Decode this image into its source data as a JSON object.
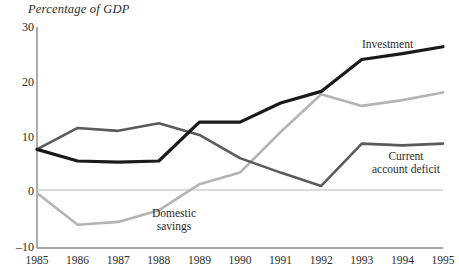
{
  "chart_data": {
    "type": "line",
    "title": "Percentage of GDP",
    "xlabel": "",
    "ylabel": "Percentage of GDP",
    "ylim": [
      -10,
      30
    ],
    "xlim": [
      1985,
      1995
    ],
    "yticks": [
      "30",
      "20",
      "10",
      "0",
      "–10"
    ],
    "ytick_values": [
      30,
      20,
      10,
      0,
      -10
    ],
    "grid": false,
    "zero_line": true,
    "legend_position": "inline-annotations",
    "categories": [
      "1985",
      "1986",
      "1987",
      "1988",
      "1989",
      "1990",
      "1991",
      "1992",
      "1993",
      "1994",
      "1995"
    ],
    "x": [
      1985,
      1986,
      1987,
      1988,
      1989,
      1990,
      1991,
      1992,
      1993,
      1994,
      1995
    ],
    "series": [
      {
        "name": "Investment",
        "color": "#1a1a1a",
        "width": 3.2,
        "values": [
          7.0,
          5.0,
          4.8,
          5.0,
          11.7,
          11.7,
          15.0,
          17.0,
          22.5,
          23.5,
          24.7
        ]
      },
      {
        "name": "Current account deficit",
        "color": "#5a5a5a",
        "width": 2.6,
        "values": [
          7.0,
          10.7,
          10.2,
          11.5,
          9.5,
          5.5,
          3.0,
          0.7,
          8.0,
          7.7,
          8.0
        ]
      },
      {
        "name": "Domestic savings",
        "color": "#b4b4b4",
        "width": 2.6,
        "values": [
          -0.5,
          -6.0,
          -5.5,
          -3.5,
          1.0,
          3.0,
          10.0,
          16.5,
          14.5,
          15.5,
          16.8
        ]
      }
    ]
  },
  "annotations": {
    "investment": "Investment",
    "current_line1": "Current",
    "current_line2": "account deficit",
    "domestic_line1": "Domestic",
    "domestic_line2": "savings"
  },
  "axes": {
    "title": "Percentage of GDP",
    "y_labels": [
      "30",
      "20",
      "10",
      "0",
      "–10"
    ],
    "x_labels": [
      "1985",
      "1986",
      "1987",
      "1988",
      "1989",
      "1990",
      "1991",
      "1992",
      "1993",
      "1994",
      "1995"
    ]
  },
  "colors": {
    "investment": "#1a1a1a",
    "current_account_deficit": "#5a5a5a",
    "domestic_savings": "#b4b4b4",
    "axis": "#8a8a8a",
    "text": "#2b2b2b"
  }
}
